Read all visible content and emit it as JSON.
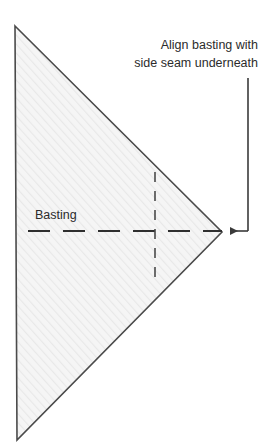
{
  "figure": {
    "background_color": "#ffffff"
  },
  "annotation": {
    "name": "align-note",
    "line1": "Align basting with",
    "line2": "side seam underneath",
    "text_color": "#2b2b2b",
    "leader": {
      "name": "leader-arrow",
      "color": "#3a3a3a",
      "vertical_x": 248,
      "vertical_y_top": 78,
      "corner_y": 231,
      "arrow_tip_x": 226
    }
  },
  "labels": {
    "basting": {
      "name": "basting-label",
      "text": "Basting",
      "color": "#2b2b2b",
      "x": 35,
      "y": 218
    }
  },
  "shapes": {
    "fabric_triangle": {
      "name": "fabric-triangle",
      "points": "15,26 222,232 17,440",
      "fill": "#f4f4f4",
      "stroke": "#4a4a4a",
      "stroke_width": 1.6,
      "hatch_color": "#e6e6e6"
    },
    "basting_line": {
      "name": "basting-dashed-line",
      "orientation": "horizontal",
      "x1": 28,
      "x2": 222,
      "y": 231,
      "color": "#2f2f2f",
      "stroke_width": 2,
      "dash": "22 13"
    },
    "side_seam_line": {
      "name": "side-seam-dashed-line",
      "orientation": "vertical",
      "x": 155,
      "y1": 172,
      "y2": 286,
      "color": "#4a4a4a",
      "stroke_width": 1.6,
      "dash": "10 9"
    }
  }
}
